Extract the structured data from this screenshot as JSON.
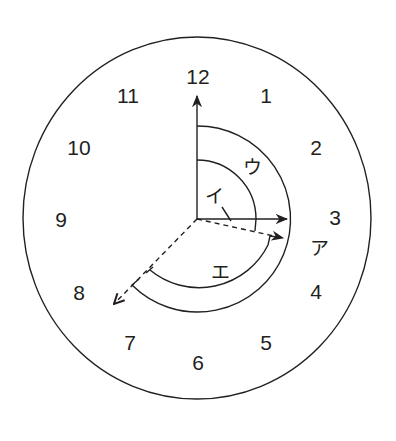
{
  "diagram": {
    "type": "clock-angle-diagram",
    "colors": {
      "ink": "#231f20",
      "background": "#ffffff"
    },
    "clock": {
      "center": [
        197,
        219
      ],
      "rx": 174,
      "ry": 181,
      "numbers": [
        {
          "label": "12",
          "x": 198,
          "y": 76
        },
        {
          "label": "1",
          "x": 266,
          "y": 95
        },
        {
          "label": "2",
          "x": 316,
          "y": 147
        },
        {
          "label": "3",
          "x": 335,
          "y": 217
        },
        {
          "label": "4",
          "x": 316,
          "y": 291
        },
        {
          "label": "5",
          "x": 266,
          "y": 342
        },
        {
          "label": "6",
          "x": 198,
          "y": 362
        },
        {
          "label": "7",
          "x": 130,
          "y": 342
        },
        {
          "label": "8",
          "x": 79,
          "y": 292
        },
        {
          "label": "9",
          "x": 61,
          "y": 219
        },
        {
          "label": "10",
          "x": 79,
          "y": 147
        },
        {
          "label": "11",
          "x": 128,
          "y": 95
        }
      ]
    },
    "hands": {
      "solid_to_12": {
        "label": "12",
        "end": [
          197,
          102
        ],
        "style": "solid"
      },
      "solid_to_3": {
        "label": "3",
        "end": [
          285,
          219
        ],
        "style": "solid"
      },
      "dashed_to_3_30": {
        "label": "between 3 and 4",
        "end": [
          283,
          238
        ],
        "style": "dashed"
      },
      "dashed_to_8": {
        "label": "toward 8",
        "end": [
          116,
          302
        ],
        "style": "dashed"
      }
    },
    "angle_labels": {
      "a": {
        "text": "ア",
        "x": 319,
        "y": 248
      },
      "i": {
        "text": "イ",
        "x": 214,
        "y": 196
      },
      "u": {
        "text": "ウ",
        "x": 252,
        "y": 167
      },
      "e": {
        "text": "エ",
        "x": 220,
        "y": 272
      }
    },
    "arcs": {
      "inner_12_to_3": {
        "radius": 59
      },
      "outer_12_to_8": {
        "radius": 93
      },
      "lower_8_to_3_30": {
        "radius": 77
      }
    }
  }
}
